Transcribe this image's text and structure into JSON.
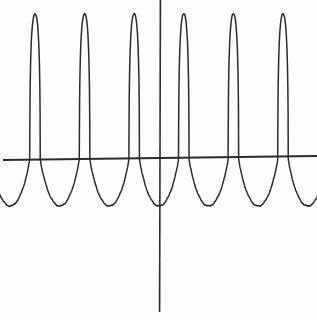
{
  "figure": {
    "name": "periodic-spike-curve",
    "width": 317,
    "height": 321,
    "background_color": "#fdfdfd",
    "ink_color": "#2b2b2b",
    "style": "hand-drawn-scan",
    "caption": ""
  },
  "axes": {
    "x_axis": {
      "label": "",
      "y_pixel": 158,
      "x_start_pixel": 3,
      "x_end_pixel": 317,
      "stroke_width": 1.8,
      "color": "#2b2b2b",
      "tick_labels": [],
      "visible": true
    },
    "y_axis": {
      "label": "",
      "x_pixel": 160,
      "y_start_pixel": 0,
      "y_end_pixel": 312,
      "stroke_width": 1.6,
      "color": "#2b2b2b",
      "tick_labels": [],
      "visible": true
    },
    "grid": false,
    "frame": false,
    "origin_pixel": [
      160,
      158
    ]
  },
  "chart_data": {
    "type": "line",
    "title": "",
    "subtitle": "",
    "xlabel": "",
    "ylabel": "",
    "legend": [],
    "legend_position": "none",
    "grid": false,
    "series": [
      {
        "name": "periodic-spike-function",
        "color": "#2b2b2b",
        "stroke_width": 1.5,
        "description": "Periodic curve with narrow tall upward spikes and wide shallow downward troughs",
        "period_px": 49.6,
        "spike_peak_y_px": 14,
        "trough_bottom_y_px": 206,
        "axis_y_px": 158,
        "spike_half_width_px": 5.2,
        "spike_crossings_px": [
          35,
          84.6,
          134.2,
          183.8,
          233.4,
          283
        ],
        "trough_centers_px": [
          10,
          59.8,
          109.4,
          159,
          208.6,
          258.2,
          307.8
        ],
        "peak_tops_px": [
          [
            35,
            14
          ],
          [
            84.6,
            14
          ],
          [
            134.2,
            14
          ],
          [
            183.8,
            14
          ],
          [
            233.4,
            14
          ],
          [
            283,
            14
          ]
        ],
        "trough_bottoms_px": [
          [
            10,
            206
          ],
          [
            59.8,
            206
          ],
          [
            109.4,
            206
          ],
          [
            159,
            206
          ],
          [
            208.6,
            206
          ],
          [
            258.2,
            206
          ],
          [
            307.8,
            206
          ]
        ]
      }
    ],
    "xlim_px": [
      0,
      317
    ],
    "ylim_px": [
      0,
      321
    ],
    "amplitude_above_axis_px": 144,
    "amplitude_below_axis_px": 48,
    "n_visible_spikes": 6,
    "n_visible_troughs": 7
  }
}
